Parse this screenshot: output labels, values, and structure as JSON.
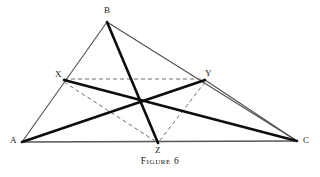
{
  "figure": {
    "caption": "Figure 6",
    "canvas": {
      "width": 320,
      "height": 177
    },
    "colors": {
      "background": "#ffffff",
      "outline_stroke": "#4f4f4f",
      "cevian_stroke": "#0d0d0d",
      "dashed_stroke": "#6e6e6e",
      "label_text": "#1a1a1a",
      "caption_text": "#171717"
    },
    "points": [
      {
        "id": "A",
        "label": "A",
        "x": 22,
        "y": 142,
        "label_x": 10,
        "label_y": 136
      },
      {
        "id": "B",
        "label": "B",
        "x": 107,
        "y": 22,
        "label_x": 104,
        "label_y": 6
      },
      {
        "id": "C",
        "label": "C",
        "x": 297,
        "y": 141,
        "label_x": 303,
        "label_y": 136
      },
      {
        "id": "X",
        "label": "X",
        "x": 64,
        "y": 80,
        "label_x": 55,
        "label_y": 70
      },
      {
        "id": "Y",
        "label": "Y",
        "x": 205,
        "y": 80,
        "label_x": 205,
        "label_y": 69
      },
      {
        "id": "Z",
        "label": "Z",
        "x": 158,
        "y": 143,
        "label_x": 155,
        "label_y": 146
      }
    ],
    "segments": {
      "triangle_outline": [
        {
          "id": "AB",
          "from": "A",
          "to": "B",
          "x1": 22,
          "y1": 142,
          "x2": 107,
          "y2": 22,
          "width": 1.1,
          "style": "solid"
        },
        {
          "id": "BC",
          "from": "B",
          "to": "C",
          "x1": 107,
          "y1": 22,
          "x2": 297,
          "y2": 141,
          "width": 1.1,
          "style": "solid"
        },
        {
          "id": "AC",
          "from": "A",
          "to": "C",
          "x1": 22,
          "y1": 142,
          "x2": 297,
          "y2": 141,
          "width": 1.3,
          "style": "solid"
        }
      ],
      "cevians": [
        {
          "id": "AY",
          "from": "A",
          "to": "Y",
          "x1": 22,
          "y1": 142,
          "x2": 205,
          "y2": 80,
          "width": 2.6,
          "style": "solid"
        },
        {
          "id": "XC",
          "from": "X",
          "to": "C",
          "x1": 64,
          "y1": 80,
          "x2": 297,
          "y2": 141,
          "width": 2.6,
          "style": "solid"
        },
        {
          "id": "BZ",
          "from": "B",
          "to": "Z",
          "x1": 107,
          "y1": 22,
          "x2": 158,
          "y2": 143,
          "width": 2.6,
          "style": "solid"
        },
        {
          "id": "YC",
          "from": "Y",
          "to": "C",
          "x1": 205,
          "y1": 80,
          "x2": 297,
          "y2": 141,
          "width": 1.1,
          "style": "solid"
        }
      ],
      "dashed": [
        {
          "id": "XY",
          "from": "X",
          "to": "Y",
          "x1": 64,
          "y1": 79,
          "x2": 205,
          "y2": 79,
          "width": 1.0,
          "dash": "4 3"
        },
        {
          "id": "XZ",
          "from": "X",
          "to": "Z",
          "x1": 64,
          "y1": 82,
          "x2": 158,
          "y2": 143,
          "width": 1.0,
          "dash": "4 3"
        },
        {
          "id": "YZ",
          "from": "Y",
          "to": "Z",
          "x1": 205,
          "y1": 82,
          "x2": 158,
          "y2": 143,
          "width": 1.0,
          "dash": "4 3"
        }
      ]
    }
  }
}
